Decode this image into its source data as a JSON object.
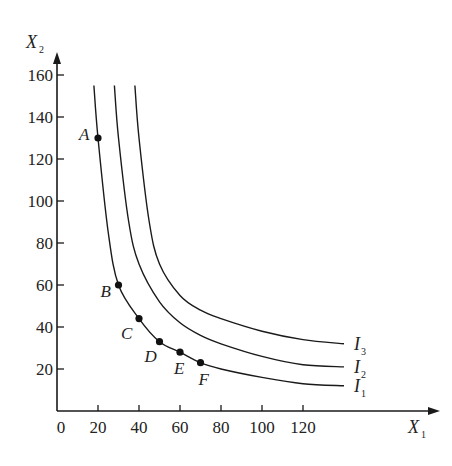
{
  "chart_data": {
    "type": "line",
    "title": "",
    "xlabel": "X",
    "xlabel_sub": "1",
    "ylabel": "X",
    "ylabel_sub": "2",
    "xlim": [
      0,
      140
    ],
    "ylim": [
      0,
      170
    ],
    "grid": false,
    "x_ticks": [
      0,
      20,
      40,
      60,
      80,
      100,
      120
    ],
    "y_ticks": [
      20,
      40,
      60,
      80,
      100,
      120,
      140,
      160
    ],
    "series": [
      {
        "name": "I",
        "sub": "1",
        "points": [
          [
            18,
            155
          ],
          [
            20,
            130
          ],
          [
            25,
            85
          ],
          [
            30,
            60
          ],
          [
            40,
            44
          ],
          [
            50,
            33
          ],
          [
            60,
            28
          ],
          [
            70,
            23
          ],
          [
            80,
            20
          ],
          [
            100,
            16
          ],
          [
            120,
            13
          ],
          [
            140,
            12
          ]
        ]
      },
      {
        "name": "I",
        "sub": "2",
        "points": [
          [
            28,
            155
          ],
          [
            30,
            130
          ],
          [
            35,
            90
          ],
          [
            40,
            70
          ],
          [
            50,
            52
          ],
          [
            60,
            42
          ],
          [
            70,
            36
          ],
          [
            80,
            32
          ],
          [
            100,
            26
          ],
          [
            120,
            22
          ],
          [
            140,
            21
          ]
        ]
      },
      {
        "name": "I",
        "sub": "3",
        "points": [
          [
            38,
            155
          ],
          [
            40,
            130
          ],
          [
            45,
            90
          ],
          [
            50,
            70
          ],
          [
            60,
            55
          ],
          [
            70,
            48
          ],
          [
            80,
            44
          ],
          [
            100,
            38
          ],
          [
            120,
            34
          ],
          [
            140,
            32
          ]
        ]
      }
    ],
    "labeled_points": [
      {
        "label": "A",
        "x": 20,
        "y": 130
      },
      {
        "label": "B",
        "x": 30,
        "y": 60
      },
      {
        "label": "C",
        "x": 40,
        "y": 44
      },
      {
        "label": "D",
        "x": 50,
        "y": 33
      },
      {
        "label": "E",
        "x": 60,
        "y": 28
      },
      {
        "label": "F",
        "x": 70,
        "y": 23
      }
    ]
  }
}
